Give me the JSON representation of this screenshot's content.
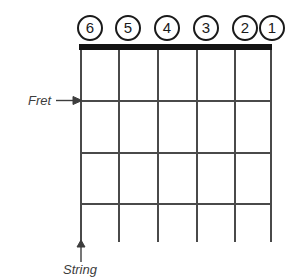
{
  "diagram": {
    "type": "guitar-fretboard-diagram",
    "background_color": "#ffffff",
    "line_color": "#4a4a4a",
    "nut_color": "#141414",
    "label_color": "#1a1a1a",
    "annotation_color": "#3d3d3d"
  },
  "string_labels": [
    {
      "number": "6",
      "icon": "circled-number-icon",
      "x": 77,
      "y": 15
    },
    {
      "number": "5",
      "icon": "circled-number-icon",
      "x": 115,
      "y": 15
    },
    {
      "number": "4",
      "icon": "circled-number-icon",
      "x": 154,
      "y": 15
    },
    {
      "number": "3",
      "icon": "circled-number-icon",
      "x": 193,
      "y": 15
    },
    {
      "number": "2",
      "icon": "circled-number-icon",
      "x": 232,
      "y": 15
    },
    {
      "number": "1",
      "icon": "circled-number-icon",
      "x": 259,
      "y": 15
    }
  ],
  "nut": {
    "x": 79,
    "y": 44,
    "width": 193,
    "height": 6
  },
  "strings": [
    {
      "name": "string-6",
      "x": 80,
      "y": 50,
      "height": 192
    },
    {
      "name": "string-5",
      "x": 118,
      "y": 50,
      "height": 192
    },
    {
      "name": "string-4",
      "x": 157,
      "y": 50,
      "height": 192
    },
    {
      "name": "string-3",
      "x": 196,
      "y": 50,
      "height": 192
    },
    {
      "name": "string-2",
      "x": 234,
      "y": 50,
      "height": 192
    },
    {
      "name": "string-1",
      "x": 270,
      "y": 50,
      "height": 192
    }
  ],
  "frets": [
    {
      "name": "fret-1",
      "x": 80,
      "y": 100,
      "width": 192
    },
    {
      "name": "fret-2",
      "x": 80,
      "y": 152,
      "width": 192
    },
    {
      "name": "fret-3",
      "x": 80,
      "y": 203,
      "width": 192
    }
  ],
  "annotations": {
    "fret": {
      "label": "Fret",
      "text_x": 28,
      "text_y": 93,
      "arrow_x": 56,
      "arrow_y": 94,
      "arrow_width": 26,
      "arrow_height": 13
    },
    "string": {
      "label": "String",
      "text_x": 63,
      "text_y": 262,
      "arrow_x": 74,
      "arrow_y": 240,
      "arrow_width": 14,
      "arrow_height": 22
    }
  }
}
